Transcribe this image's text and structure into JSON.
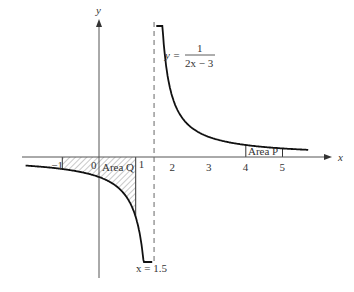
{
  "chart_data": {
    "type": "line",
    "title": "",
    "function": "y = 1/(2x - 3)",
    "equation_label": {
      "lhs": "y =",
      "numerator": "1",
      "denominator": "2x − 3"
    },
    "xlabel": "x",
    "ylabel": "y",
    "x_ticks": [
      "−1",
      "0",
      "1",
      "2",
      "3",
      "4",
      "5"
    ],
    "x_tick_values": [
      -1,
      0,
      1,
      2,
      3,
      4,
      5
    ],
    "asymptote": {
      "x": 1.5,
      "label": "x = 1.5"
    },
    "shaded_regions": [
      {
        "name": "Area Q",
        "label": "Area Q",
        "x_from": -1,
        "x_to": 1,
        "hatched": true
      },
      {
        "name": "Area P",
        "label": "Area P",
        "x_from": 4,
        "x_to": 5,
        "hatched": false
      }
    ],
    "branches": [
      {
        "x_from": -2,
        "x_to": 1.45
      },
      {
        "x_from": 1.56,
        "x_to": 5.7
      }
    ],
    "grid": false,
    "legend": null
  },
  "layout": {
    "origin_px": [
      99,
      157
    ],
    "x_unit_px": 36.7,
    "y_unit_px": 60,
    "colors": {
      "curve": "#111111",
      "axis": "#555555",
      "asymptote": "#666666",
      "text": "#333333"
    }
  }
}
